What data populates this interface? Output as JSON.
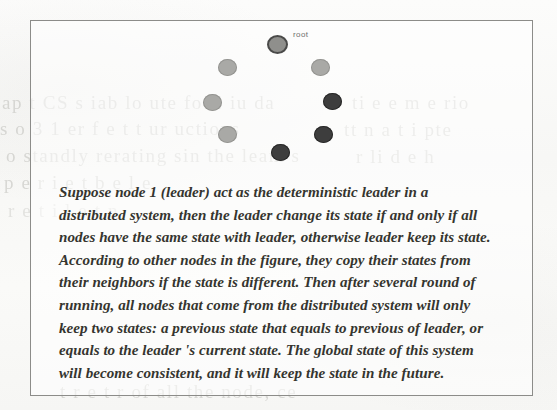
{
  "page": {
    "background_color": "#fbfbfa",
    "ink_color": "#35352f"
  },
  "figure": {
    "border_color": "#8d8d8a",
    "graph": {
      "label_root": "root",
      "node_colors": {
        "light": "#a9a9a6",
        "dark": "#3d3d3d",
        "root": "#8f8f8c"
      },
      "nodes": [
        {
          "id": "root",
          "label": "root",
          "state": "root",
          "x": 236,
          "y": 14
        },
        {
          "id": "n2",
          "label": "",
          "state": "light",
          "x": 187,
          "y": 38
        },
        {
          "id": "n3",
          "label": "",
          "state": "light",
          "x": 280,
          "y": 38
        },
        {
          "id": "n4",
          "label": "",
          "state": "light",
          "x": 172,
          "y": 73
        },
        {
          "id": "n5",
          "label": "",
          "state": "dark",
          "x": 292,
          "y": 72
        },
        {
          "id": "n6",
          "label": "",
          "state": "light",
          "x": 187,
          "y": 105
        },
        {
          "id": "n7",
          "label": "",
          "state": "dark",
          "x": 283,
          "y": 105
        },
        {
          "id": "n8",
          "label": "",
          "state": "dark",
          "x": 240,
          "y": 123
        }
      ]
    },
    "caption": "Suppose node 1 (leader) act as the deterministic leader in a distributed system, then the leader change its state if and only if all nodes have the same state with leader, otherwise leader keep its state. According to other nodes in the figure, they copy their states from their neighbors if the state is different. Then after several round of running, all nodes that come from the distributed system will only keep two states: a previous state that equals to previous of leader, or equals to the leader 's current state. The global state of this system will become consistent, and it will keep the state in the future."
  },
  "bleed_through": {
    "left": [
      "ap  t   CS  s iab lo ute fo C iu da",
      "s o   3 1 er   f  e t  t  ur  uctions",
      "o standly   rerating  sin  the leam s",
      "p e    r   i  e  t   b   e  l  e",
      "t   r   e  t  r   of  all  the  node, ce",
      "r  e t     i    l  e   t n"
    ],
    "right": [
      "ti   e e m  e   rio",
      "tt  n  a  t  i   pte",
      "r li  d  e    h"
    ]
  }
}
